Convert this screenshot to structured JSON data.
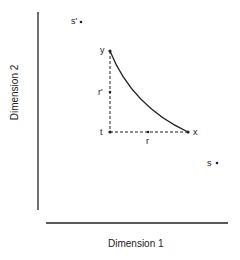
{
  "axes": {
    "x_title": "Dimension 1",
    "y_title": "Dimension 2"
  },
  "points": {
    "s_prime": "s'",
    "y": "y",
    "t": "t",
    "x": "x",
    "s": "s"
  },
  "segments": {
    "r_prime": "r'",
    "r": "r"
  },
  "colors": {
    "ink": "#222222",
    "background": "#ffffff"
  }
}
